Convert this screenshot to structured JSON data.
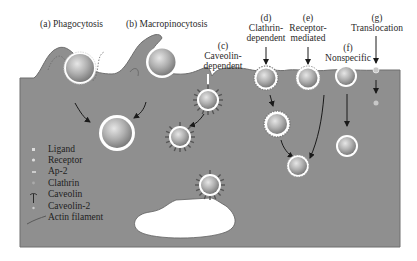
{
  "figure": {
    "colors": {
      "cytoplasm": "#8f8f8f",
      "membrane_edge": "#6e6e6e",
      "particle": "#b9b9b9",
      "vesicle_ring": "#ffffff",
      "arrow": "#1a1a1a",
      "background": "#ffffff"
    }
  },
  "pathways": [
    {
      "id": "a",
      "label_letter": "(a)",
      "label": "(a) Phagocytosis"
    },
    {
      "id": "b",
      "label_letter": "(b)",
      "label": "(b) Macropinocytosis"
    },
    {
      "id": "c",
      "label_letter": "(c)",
      "line1": "Caveolin-",
      "line2": "dependent"
    },
    {
      "id": "d",
      "label_letter": "(d)",
      "line1": "Clathrin-",
      "line2": "dependent"
    },
    {
      "id": "e",
      "label_letter": "(e)",
      "line1": "Receptor-",
      "line2": "mediated"
    },
    {
      "id": "f",
      "label_letter": "(f)",
      "line1": "Nonspecific"
    },
    {
      "id": "g",
      "label_letter": "(g)",
      "line1": "Translocation"
    }
  ],
  "legend": {
    "items": [
      {
        "icon": "ligand-icon",
        "label": "Ligand"
      },
      {
        "icon": "receptor-icon",
        "label": "Receptor"
      },
      {
        "icon": "ap2-icon",
        "label": "Ap-2"
      },
      {
        "icon": "clathrin-icon",
        "label": "Clathrin"
      },
      {
        "icon": "caveolin-icon",
        "label": "Caveolin"
      },
      {
        "icon": "caveolin2-icon",
        "label": "Caveolin-2"
      },
      {
        "icon": "actin-filament-icon",
        "label": "Actin filament"
      }
    ]
  }
}
